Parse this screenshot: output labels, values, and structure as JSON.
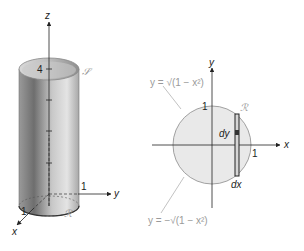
{
  "left_figure": {
    "axes": {
      "z_label": "z",
      "y_label": "y",
      "x_label": "x"
    },
    "ticks": {
      "z_height": "4",
      "y_unit": "1",
      "x_unit": "1"
    },
    "surface_label": "𝒮",
    "region_label": "ℛ",
    "shape": "cylinder",
    "colors": {
      "cylinder_dark": "#7a7a7a",
      "cylinder_light": "#e0e0e0",
      "axis": "#222222"
    }
  },
  "right_figure": {
    "axes": {
      "y_label": "y",
      "x_label": "x"
    },
    "ticks": {
      "y_unit": "1",
      "x_unit": "1"
    },
    "upper_curve_label": "y = √(1 − x²)",
    "lower_curve_label": "y = −√(1 − x²)",
    "region_label": "ℛ",
    "strip_labels": {
      "dy": "dy",
      "dx": "dx"
    },
    "shape": "unit-disk",
    "colors": {
      "disk_fill": "#e9e9e9",
      "disk_outline": "#8a8a8a",
      "strip": "#222222"
    }
  }
}
